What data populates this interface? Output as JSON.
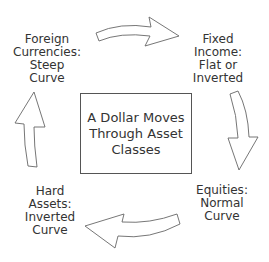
{
  "diagram": {
    "center": {
      "text": "A Dollar Moves\nThrough Asset\nClasses"
    },
    "nodes": [
      {
        "id": "foreign-currencies",
        "text": "Foreign\nCurrencies:\nSteep\nCurve"
      },
      {
        "id": "fixed-income",
        "text": "Fixed\nIncome:\nFlat or\nInverted"
      },
      {
        "id": "equities",
        "text": "Equities:\nNormal\nCurve"
      },
      {
        "id": "hard-assets",
        "text": "Hard\nAssets:\nInverted\nCurve"
      }
    ],
    "edges": [
      {
        "from": "foreign-currencies",
        "to": "fixed-income"
      },
      {
        "from": "fixed-income",
        "to": "equities"
      },
      {
        "from": "equities",
        "to": "hard-assets"
      },
      {
        "from": "hard-assets",
        "to": "foreign-currencies"
      }
    ]
  }
}
